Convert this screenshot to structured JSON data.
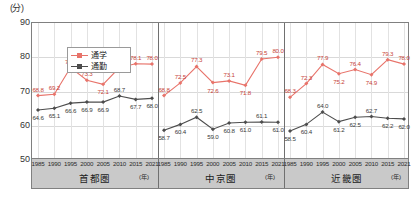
{
  "chart_data": {
    "type": "line",
    "title": "",
    "ylabel": "(分)",
    "xlabel": "(年)",
    "ylim": [
      50,
      90
    ],
    "yticks": [
      50,
      60,
      70,
      80,
      90
    ],
    "grid": true,
    "legend_position": "top-left",
    "categories": [
      "1985",
      "1990",
      "1995",
      "2000",
      "2005",
      "2010",
      "2015",
      "2021"
    ],
    "legend": [
      {
        "name": "通学",
        "color": "#e8736a"
      },
      {
        "name": "通勤",
        "color": "#4d4d4d"
      }
    ],
    "panels": [
      {
        "name": "首都圏",
        "series": [
          {
            "name": "通学",
            "color": "#e8736a",
            "values": [
              68.8,
              69.2,
              77.0,
              73.3,
              72.1,
              77.0,
              78.1,
              78.0
            ]
          },
          {
            "name": "通勤",
            "color": "#4d4d4d",
            "values": [
              64.6,
              65.1,
              66.6,
              66.9,
              66.9,
              68.7,
              67.7,
              68.0
            ]
          }
        ]
      },
      {
        "name": "中京圏",
        "series": [
          {
            "name": "通学",
            "color": "#e8736a",
            "values": [
              68.8,
              72.5,
              77.3,
              72.6,
              73.1,
              71.8,
              79.5,
              80.0
            ]
          },
          {
            "name": "通勤",
            "color": "#4d4d4d",
            "values": [
              58.7,
              60.4,
              62.5,
              59.0,
              60.8,
              61.0,
              61.1,
              61.0
            ]
          }
        ]
      },
      {
        "name": "近畿圏",
        "series": [
          {
            "name": "通学",
            "color": "#e8736a",
            "values": [
              68.3,
              72.3,
              77.9,
              75.2,
              76.4,
              74.9,
              79.3,
              78.0
            ]
          },
          {
            "name": "通勤",
            "color": "#4d4d4d",
            "values": [
              58.5,
              60.4,
              64.0,
              61.2,
              62.5,
              62.7,
              62.2,
              62.0
            ]
          }
        ]
      }
    ]
  },
  "colors": {
    "school": "#e8736a",
    "commute": "#4d4d4d",
    "band": "#c9c9c9",
    "frame": "#808080"
  }
}
